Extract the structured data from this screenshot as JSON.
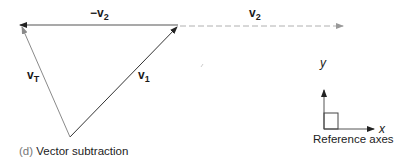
{
  "figure": {
    "caption_tag": "(d)",
    "caption_text": "Vector subtraction",
    "vectors": {
      "neg_v2": {
        "sign": "−",
        "name": "v",
        "sub": "2"
      },
      "v2": {
        "name": "v",
        "sub": "2"
      },
      "v1": {
        "name": "v",
        "sub": "1"
      },
      "vT": {
        "name": "v",
        "sub": "T"
      }
    },
    "reference_axes": {
      "label": "Reference axes",
      "x_label": "x",
      "y_label": "y"
    },
    "colors": {
      "solid_line": "#333333",
      "light_line": "#999999",
      "dashed_line": "#aaaaaa",
      "text": "#1a1a1a",
      "caption_tag": "#777777"
    }
  }
}
